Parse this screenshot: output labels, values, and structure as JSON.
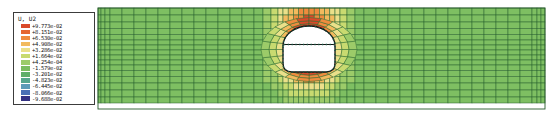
{
  "legend": {
    "title": "U, U2",
    "entries": [
      {
        "value": "+9.773e-02",
        "color": "#d94a2a"
      },
      {
        "value": "+8.151e-02",
        "color": "#e5662f"
      },
      {
        "value": "+6.530e-02",
        "color": "#ef8c3e"
      },
      {
        "value": "+4.908e-02",
        "color": "#f2ba5e"
      },
      {
        "value": "+3.286e-02",
        "color": "#ebe08a"
      },
      {
        "value": "+1.664e-02",
        "color": "#c8da70"
      },
      {
        "value": "+4.254e-04",
        "color": "#9ccb69"
      },
      {
        "value": "-1.579e-02",
        "color": "#7abc5f"
      },
      {
        "value": "-3.201e-02",
        "color": "#5fae6a"
      },
      {
        "value": "-4.823e-02",
        "color": "#55a68d"
      },
      {
        "value": "-6.445e-02",
        "color": "#5c9bb8"
      },
      {
        "value": "-8.066e-02",
        "color": "#4a70b5"
      },
      {
        "value": "-9.688e-02",
        "color": "#343283"
      }
    ]
  },
  "chart_data": {
    "type": "heatmap",
    "title": "U, U2",
    "field_name": "U, U2 (vertical displacement contour, FEA result)",
    "contour_levels": [
      0.09773,
      0.08151,
      0.0653,
      0.04908,
      0.03286,
      0.01664,
      0.0004254,
      -0.01579,
      -0.03201,
      -0.04823,
      -0.06445,
      -0.08066,
      -0.09688
    ],
    "contour_labels": [
      "+9.773e-02",
      "+8.151e-02",
      "+6.530e-02",
      "+4.908e-02",
      "+3.286e-02",
      "+1.664e-02",
      "+4.254e-04",
      "-1.579e-02",
      "-3.201e-02",
      "-4.823e-02",
      "-6.445e-02",
      "-8.066e-02",
      "-9.688e-02"
    ],
    "contour_colors": [
      "#d94a2a",
      "#e5662f",
      "#ef8c3e",
      "#f2ba5e",
      "#ebe08a",
      "#c8da70",
      "#9ccb69",
      "#7abc5f",
      "#5fae6a",
      "#55a68d",
      "#5c9bb8",
      "#4a70b5",
      "#343283"
    ],
    "legend_position": "left"
  },
  "mesh": {
    "field_color": "#7ebf62",
    "line_color": "#2f6a33",
    "border_color": "#27592b",
    "viewport": {
      "x": 98,
      "y": 8,
      "w": 447,
      "h": 101
    },
    "col_widths": [
      3,
      4,
      5,
      12,
      12,
      12,
      12,
      12,
      12,
      12,
      12,
      12,
      12,
      12,
      12,
      9,
      8,
      7,
      5,
      5.2,
      5.2,
      5.2,
      5.2,
      5.2,
      5.2,
      5.2,
      5.2,
      5.2,
      5.2,
      5,
      7,
      8,
      9,
      12,
      12,
      12,
      12,
      12,
      12,
      12,
      12,
      12,
      12,
      12,
      12,
      12,
      12,
      5,
      4,
      4
    ],
    "row_heights": [
      7,
      7,
      6.5,
      6,
      5.5,
      5,
      5,
      5,
      5,
      5,
      5.5,
      6,
      6.5,
      7,
      7,
      6
    ],
    "tunnel": {
      "cx": 309,
      "cy": 49.5,
      "rx": 26,
      "ry": 23,
      "outer_rx": 48,
      "outer_ry": 32,
      "left_x": 283,
      "right_x": 335,
      "spring_y": 46,
      "arch_ry": 20,
      "floor_y": 72,
      "corner_r": 9,
      "strut_y": 44.5,
      "liner_color": "#151515",
      "node_dot_color": "#1b5a45",
      "interior_color": "#ffffff"
    },
    "bands": {
      "thresholds": [
        0.88,
        0.74,
        0.6,
        0.47,
        0.35,
        0.22
      ],
      "colors": [
        "#d94a2a",
        "#ef8c3e",
        "#f2ba5e",
        "#ebe08a",
        "#c8da70",
        "#9ccb69",
        "#7ebf62"
      ]
    },
    "field": {
      "base": 0.6,
      "vert_gain": 0.44,
      "k_side": 1.3,
      "k_up": 0.35,
      "k_down": 0.95,
      "skip_factor": 0.93
    },
    "rings": [
      0,
      0.32,
      0.64,
      1.0
    ],
    "spokes": 24
  }
}
